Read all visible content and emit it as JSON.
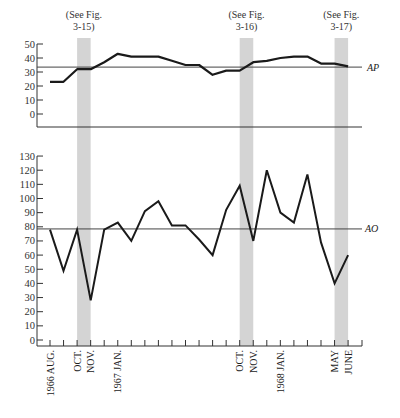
{
  "chart_data": [
    {
      "type": "line",
      "panel": "upper",
      "title": "",
      "series_label": "AP",
      "xlabel": "",
      "ylabel": "",
      "ylim": [
        -10,
        50
      ],
      "yticks": [
        0,
        10,
        20,
        30,
        40,
        50
      ],
      "reference_line": {
        "label": "AP",
        "value": 33.5
      },
      "x": [
        "1966 AUG.",
        "SEP.",
        "OCT.",
        "NOV.",
        "DEC.",
        "1967 JAN.",
        "FEB.",
        "MAR.",
        "APR.",
        "MAY",
        "JUNE",
        "JULY",
        "AUG.",
        "SEP.",
        "OCT.",
        "NOV.",
        "DEC.",
        "1968 JAN.",
        "FEB.",
        "MAR.",
        "APR.",
        "MAY",
        "JUNE"
      ],
      "values": [
        23,
        23,
        32,
        32,
        37,
        43,
        41,
        41,
        41,
        38,
        35,
        35,
        28,
        31,
        31,
        37,
        38,
        40,
        41,
        41,
        36,
        36,
        34
      ],
      "grid": false
    },
    {
      "type": "line",
      "panel": "lower",
      "title": "",
      "series_label": "AO",
      "xlabel": "",
      "ylabel": "",
      "ylim": [
        0,
        130
      ],
      "yticks": [
        0,
        10,
        20,
        30,
        40,
        50,
        60,
        70,
        80,
        90,
        100,
        110,
        120,
        130
      ],
      "reference_line": {
        "label": "AO",
        "value": 78.5
      },
      "x": [
        "1966 AUG.",
        "SEP.",
        "OCT.",
        "NOV.",
        "DEC.",
        "1967 JAN.",
        "FEB.",
        "MAR.",
        "APR.",
        "MAY",
        "JUNE",
        "JULY",
        "AUG.",
        "SEP.",
        "OCT.",
        "NOV.",
        "DEC.",
        "1968 JAN.",
        "FEB.",
        "MAR.",
        "APR.",
        "MAY",
        "JUNE"
      ],
      "values": [
        78,
        49,
        78,
        28,
        78,
        83,
        70,
        91,
        98,
        81,
        81,
        71,
        60,
        92,
        109,
        70,
        120,
        90,
        83,
        117,
        69,
        40,
        60
      ],
      "grid": false
    }
  ],
  "annotations": {
    "notes": [
      {
        "line1": "(See Fig.",
        "line2": "3-15)",
        "band_start_index": 2,
        "band_end_index": 3
      },
      {
        "line1": "(See Fig.",
        "line2": "3-16)",
        "band_start_index": 14,
        "band_end_index": 15
      },
      {
        "line1": "(See Fig.",
        "line2": "3-17)",
        "band_start_index": 21,
        "band_end_index": 22
      }
    ],
    "series_labels": {
      "ap": "AP",
      "ao": "AO"
    }
  },
  "axis": {
    "upper_y_ticks": [
      "50",
      "40",
      "30",
      "20",
      "10",
      "0"
    ],
    "lower_y_ticks": [
      "130",
      "120",
      "110",
      "100",
      "90",
      "80",
      "70",
      "60",
      "50",
      "40",
      "30",
      "20",
      "10",
      "0"
    ],
    "x_labels": [
      {
        "text": "1966 AUG.",
        "index": 0
      },
      {
        "text": "OCT.",
        "index": 2
      },
      {
        "text": "NOV.",
        "index": 3
      },
      {
        "text": "1967 JAN.",
        "index": 5
      },
      {
        "text": "OCT.",
        "index": 14
      },
      {
        "text": "NOV.",
        "index": 15
      },
      {
        "text": "1968 JAN.",
        "index": 17
      },
      {
        "text": "MAY",
        "index": 21
      },
      {
        "text": "JUNE",
        "index": 22
      }
    ]
  },
  "colors": {
    "line": "#1a1a1a",
    "axis": "#333333",
    "band": "#d4d4d4"
  }
}
